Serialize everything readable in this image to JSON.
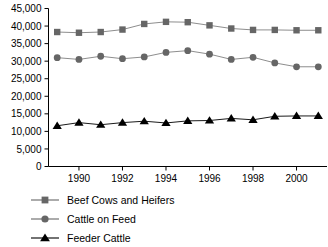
{
  "chart_data": {
    "type": "line",
    "title": "",
    "subtitle": "",
    "xlabel": "",
    "ylabel": "",
    "x": [
      1989,
      1990,
      1991,
      1992,
      1993,
      1994,
      1995,
      1996,
      1997,
      1998,
      1999,
      2000,
      2001
    ],
    "xtick_labels": [
      "1990",
      "1992",
      "1994",
      "1996",
      "1998",
      "2000"
    ],
    "xtick_values": [
      1990,
      1992,
      1994,
      1996,
      1998,
      2000
    ],
    "xlim": [
      1988.6,
      2001.4
    ],
    "ytick_labels": [
      "0",
      "5,000",
      "10,000",
      "15,000",
      "20,000",
      "25,000",
      "30,000",
      "35,000",
      "40,000",
      "45,000"
    ],
    "ytick_values": [
      0,
      5000,
      10000,
      15000,
      20000,
      25000,
      30000,
      35000,
      40000,
      45000
    ],
    "ylim": [
      0,
      45000
    ],
    "grid": false,
    "legend_position": "bottom-left",
    "series": [
      {
        "name": "Beef Cows and Heifers",
        "marker": "square",
        "color": "#666666",
        "line_color": "#808080",
        "values": [
          38300,
          38100,
          38300,
          39000,
          40600,
          41200,
          41100,
          40200,
          39300,
          38900,
          38900,
          38800,
          38800
        ]
      },
      {
        "name": "Cattle on Feed",
        "marker": "circle",
        "color": "#666666",
        "line_color": "#808080",
        "values": [
          31000,
          30500,
          31400,
          30700,
          31200,
          32500,
          33000,
          32000,
          30500,
          31100,
          29500,
          28400,
          28400
        ]
      },
      {
        "name": "Feeder Cattle",
        "marker": "triangle",
        "color": "#000000",
        "line_color": "#000000",
        "values": [
          11600,
          12500,
          11900,
          12500,
          12900,
          12400,
          13000,
          13100,
          13700,
          13300,
          14300,
          14400,
          14400
        ]
      }
    ]
  },
  "legend": {
    "items": [
      {
        "label": "Beef Cows and Heifers",
        "marker": "square",
        "color": "#666666"
      },
      {
        "label": "Cattle on Feed",
        "marker": "circle",
        "color": "#666666"
      },
      {
        "label": "Feeder Cattle",
        "marker": "triangle",
        "color": "#000000"
      }
    ]
  }
}
